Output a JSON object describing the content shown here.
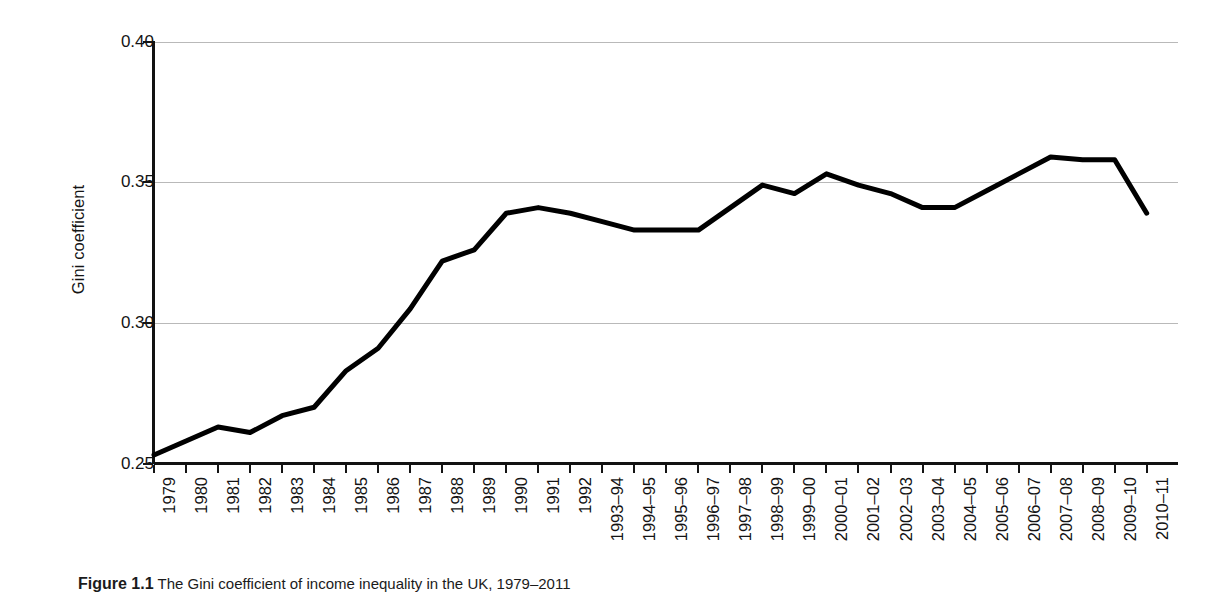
{
  "figure": {
    "caption_label": "Figure 1.1",
    "caption_text": "The Gini coefficient of income inequality in the UK, 1979–2011"
  },
  "axes": {
    "y_title": "Gini coefficient",
    "y_ticks": [
      "0.40",
      "0.35",
      "0.30",
      "0.25"
    ],
    "x_title": ""
  },
  "chart_data": {
    "type": "line",
    "title": "The Gini coefficient of income inequality in the UK, 1979–2011",
    "xlabel": "",
    "ylabel": "Gini coefficient",
    "ylim": [
      0.25,
      0.4
    ],
    "yticks": [
      0.25,
      0.3,
      0.35,
      0.4
    ],
    "grid": true,
    "legend": "none",
    "line_color": "#000000",
    "categories": [
      "1979",
      "1980",
      "1981",
      "1982",
      "1983",
      "1984",
      "1985",
      "1986",
      "1987",
      "1988",
      "1989",
      "1990",
      "1991",
      "1992",
      "1993–94",
      "1994–95",
      "1995–96",
      "1996–97",
      "1997–98",
      "1998–99",
      "1999–00",
      "2000–01",
      "2001–02",
      "2002–03",
      "2003–04",
      "2004–05",
      "2005–06",
      "2006–07",
      "2007–08",
      "2008–09",
      "2009–10",
      "2010–11"
    ],
    "values": [
      0.253,
      0.258,
      0.263,
      0.261,
      0.267,
      0.27,
      0.283,
      0.291,
      0.305,
      0.322,
      0.326,
      0.339,
      0.341,
      0.339,
      0.336,
      0.333,
      0.333,
      0.333,
      0.341,
      0.349,
      0.346,
      0.353,
      0.349,
      0.346,
      0.341,
      0.341,
      0.347,
      0.353,
      0.359,
      0.358,
      0.358,
      0.339
    ]
  }
}
